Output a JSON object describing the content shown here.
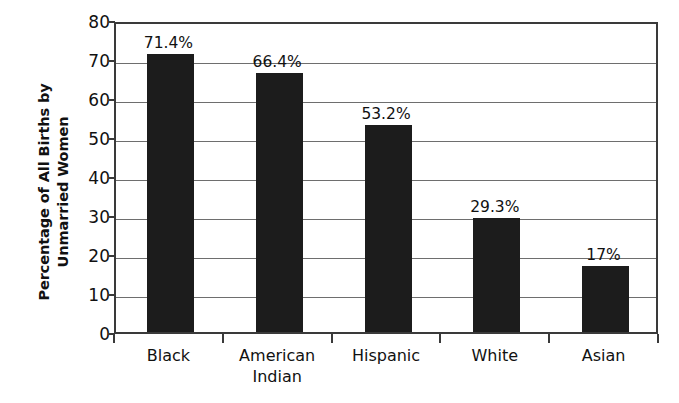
{
  "chart_data": {
    "type": "bar",
    "title": "",
    "xlabel": "",
    "ylabel": "Percentage of All Births by Unmarried Women",
    "ylabel_lines": [
      "Percentage of All Births by",
      "Unmarried Women"
    ],
    "categories": [
      "Black",
      "American Indian",
      "Hispanic",
      "White",
      "Asian"
    ],
    "category_lines": [
      [
        "Black"
      ],
      [
        "American",
        "Indian"
      ],
      [
        "Hispanic"
      ],
      [
        "White"
      ],
      [
        "Asian"
      ]
    ],
    "values": [
      71.4,
      66.4,
      53.2,
      29.3,
      17
    ],
    "data_labels": [
      "71.4%",
      "66.4%",
      "53.2%",
      "29.3%",
      "17%"
    ],
    "ylim": [
      0,
      80
    ],
    "ytick_values": [
      0,
      10,
      20,
      30,
      40,
      50,
      60,
      70,
      80
    ],
    "ytick_labels": [
      "0",
      "10",
      "20",
      "30",
      "40",
      "50",
      "60",
      "70",
      "80"
    ],
    "grid": true,
    "grid_axis": "y",
    "legend": "none",
    "bar_color": "#1c1c1c",
    "axis_color": "#3a3a3a",
    "grid_color": "#6e6e6e",
    "background_color": "#ffffff"
  }
}
